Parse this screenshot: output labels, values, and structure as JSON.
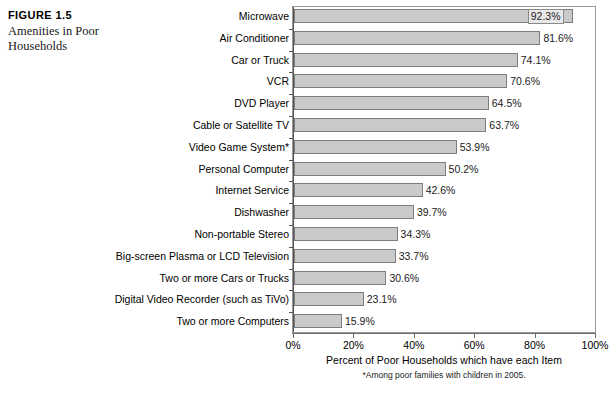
{
  "figure": {
    "number": "FIGURE 1.5",
    "title": "Amenities in Poor Households"
  },
  "chart_data": {
    "type": "bar",
    "orientation": "horizontal",
    "title": "Amenities in Poor Households",
    "xlabel": "Percent of Poor Households which have each Item",
    "ylabel": "",
    "xlim": [
      0,
      100
    ],
    "grid": false,
    "legend": null,
    "footnote": "*Among poor families with children in 2005.",
    "tick_labels": [
      "0%",
      "20%",
      "40%",
      "60%",
      "80%",
      "100%"
    ],
    "ticks": [
      0,
      20,
      40,
      60,
      80,
      100
    ],
    "bar_color": "#cacaca",
    "bar_border_color": "#7d7d7d",
    "categories": [
      "Microwave",
      "Air Conditioner",
      "Car or Truck",
      "VCR",
      "DVD Player",
      "Cable or Satellite TV",
      "Video Game System*",
      "Personal Computer",
      "Internet Service",
      "Dishwasher",
      "Non-portable Stereo",
      "Big-screen Plasma or LCD Television",
      "Two or more Cars or Trucks",
      "Digital Video Recorder (such as TiVo)",
      "Two or more Computers"
    ],
    "values": [
      92.3,
      81.6,
      74.1,
      70.6,
      64.5,
      63.7,
      53.9,
      50.2,
      42.6,
      39.7,
      34.3,
      33.7,
      30.6,
      23.1,
      15.9
    ],
    "value_labels": [
      "92.3%",
      "81.6%",
      "74.1%",
      "70.6%",
      "64.5%",
      "63.7%",
      "53.9%",
      "50.2%",
      "42.6%",
      "39.7%",
      "34.3%",
      "33.7%",
      "30.6%",
      "23.1%",
      "15.9%"
    ],
    "label_placement": [
      "inside",
      "outside",
      "outside",
      "outside",
      "outside",
      "outside",
      "outside",
      "outside",
      "outside",
      "outside",
      "outside",
      "outside",
      "outside",
      "outside",
      "outside"
    ]
  }
}
